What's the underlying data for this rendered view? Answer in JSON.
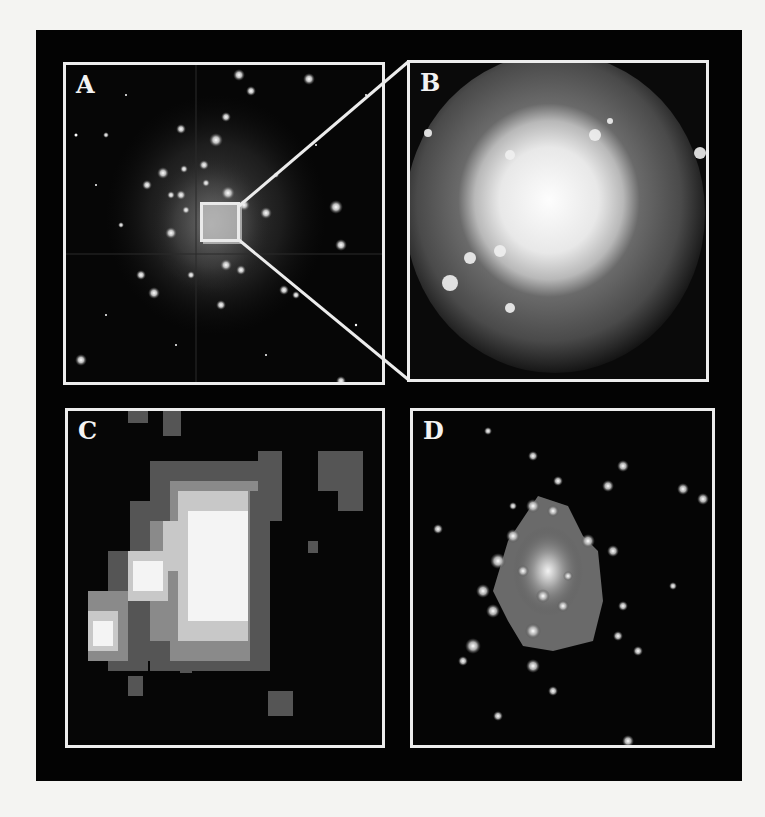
{
  "figure": {
    "background_color": "#030303",
    "border_color": "#ededed",
    "panels": [
      {
        "id": "A",
        "label": "A",
        "description": "Wide-field star cluster image with inset zoom box"
      },
      {
        "id": "B",
        "label": "B",
        "description": "Magnified view of cluster core, bright diffuse glow"
      },
      {
        "id": "C",
        "label": "C",
        "description": "Low-resolution pixelated image of cluster core"
      },
      {
        "id": "D",
        "label": "D",
        "description": "High-resolution image resolving individual stars in core"
      }
    ],
    "zoom_box": {
      "panel": "A",
      "target": "B"
    }
  }
}
